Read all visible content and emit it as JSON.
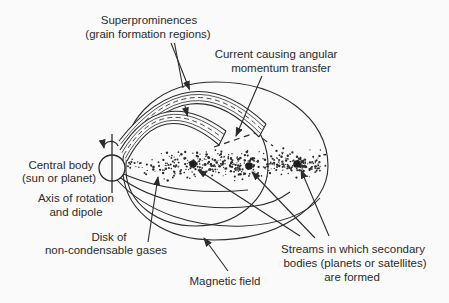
{
  "diagram": {
    "title_hint": "Formation of secondary bodies around a magnetized central body",
    "background": "#fafafa",
    "ink": "#2b2b2b",
    "labels": {
      "superprominences": {
        "line1": "Superprominences",
        "line2": "(grain formation regions)"
      },
      "current": {
        "line1": "Current causing angular",
        "line2": "momentum transfer"
      },
      "central_body": {
        "line1": "Central body",
        "line2": "(sun or planet)"
      },
      "axis": {
        "line1": "Axis of rotation",
        "line2": "and dipole"
      },
      "disk": {
        "line1": "Disk of",
        "line2": "non-condensable gases"
      },
      "magnetic_field": {
        "line1": "Magnetic field"
      },
      "streams": {
        "line1": "Streams in which secondary",
        "line2": "bodies (planets or satellites)",
        "line3": "are formed"
      }
    },
    "streams": {
      "dots": [
        {
          "x": 193,
          "y": 164
        },
        {
          "x": 249,
          "y": 166
        },
        {
          "x": 297,
          "y": 164
        }
      ],
      "dot_radius": 3.8,
      "cluster_spread_x": [
        20,
        16,
        14
      ],
      "cluster_spread_y": 6.5,
      "cluster_dot_count": 115,
      "trail_dot_count": 135,
      "trail_x_min": 127,
      "trail_x_max": 322
    }
  }
}
